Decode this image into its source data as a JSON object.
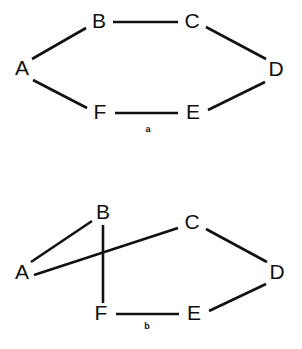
{
  "figures": [
    {
      "caption": "a",
      "caption_pos": {
        "x": 148,
        "y": 130
      },
      "nodes": [
        {
          "id": "A",
          "label": "A",
          "x": 22,
          "y": 69
        },
        {
          "id": "B",
          "label": "B",
          "x": 99,
          "y": 22
        },
        {
          "id": "C",
          "label": "C",
          "x": 192,
          "y": 22
        },
        {
          "id": "D",
          "label": "D",
          "x": 276,
          "y": 70
        },
        {
          "id": "E",
          "label": "E",
          "x": 193,
          "y": 113
        },
        {
          "id": "F",
          "label": "F",
          "x": 100,
          "y": 113
        }
      ],
      "edges": [
        {
          "from": "A",
          "to": "B",
          "x1": 32,
          "y1": 59,
          "x2": 86,
          "y2": 28
        },
        {
          "from": "B",
          "to": "C",
          "x1": 113,
          "y1": 22,
          "x2": 178,
          "y2": 22
        },
        {
          "from": "C",
          "to": "D",
          "x1": 206,
          "y1": 27,
          "x2": 266,
          "y2": 59
        },
        {
          "from": "D",
          "to": "E",
          "x1": 265,
          "y1": 82,
          "x2": 208,
          "y2": 110
        },
        {
          "from": "E",
          "to": "F",
          "x1": 178,
          "y1": 113,
          "x2": 115,
          "y2": 113
        },
        {
          "from": "F",
          "to": "A",
          "x1": 87,
          "y1": 108,
          "x2": 33,
          "y2": 80
        }
      ]
    },
    {
      "caption": "b",
      "caption_pos": {
        "x": 147,
        "y": 327
      },
      "nodes": [
        {
          "id": "A",
          "label": "A",
          "x": 22,
          "y": 273
        },
        {
          "id": "B",
          "label": "B",
          "x": 103,
          "y": 213
        },
        {
          "id": "C",
          "label": "C",
          "x": 192,
          "y": 223
        },
        {
          "id": "D",
          "label": "D",
          "x": 277,
          "y": 273
        },
        {
          "id": "E",
          "label": "E",
          "x": 194,
          "y": 314
        },
        {
          "id": "F",
          "label": "F",
          "x": 101,
          "y": 314
        }
      ],
      "edges": [
        {
          "from": "A",
          "to": "B",
          "x1": 31,
          "y1": 262,
          "x2": 92,
          "y2": 221
        },
        {
          "from": "A",
          "to": "C",
          "x1": 34,
          "y1": 275,
          "x2": 178,
          "y2": 228
        },
        {
          "from": "B",
          "to": "F",
          "x1": 103,
          "y1": 225,
          "x2": 103,
          "y2": 303
        },
        {
          "from": "C",
          "to": "D",
          "x1": 206,
          "y1": 229,
          "x2": 267,
          "y2": 262
        },
        {
          "from": "D",
          "to": "E",
          "x1": 266,
          "y1": 284,
          "x2": 209,
          "y2": 311
        },
        {
          "from": "E",
          "to": "F",
          "x1": 179,
          "y1": 314,
          "x2": 116,
          "y2": 314
        }
      ]
    }
  ]
}
